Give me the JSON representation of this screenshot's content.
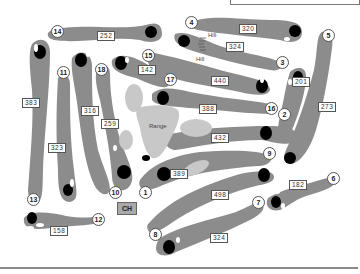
{
  "map": {
    "title": "Golf course layout",
    "colors": {
      "fairway": "#8c8c8c",
      "green": "#000000",
      "hazard_light": "#c8c8c8",
      "tee": "#ffffff",
      "background": "#ffffff"
    },
    "holes": [
      {
        "number": "1",
        "yardage": "389"
      },
      {
        "number": "2",
        "yardage": "201"
      },
      {
        "number": "3",
        "yardage": "324"
      },
      {
        "number": "4",
        "yardage": "320"
      },
      {
        "number": "5",
        "yardage": "273"
      },
      {
        "number": "6",
        "yardage": "182"
      },
      {
        "number": "7",
        "yardage": "324"
      },
      {
        "number": "8",
        "yardage": "498"
      },
      {
        "number": "9",
        "yardage": "432"
      },
      {
        "number": "10",
        "yardage": "259"
      },
      {
        "number": "11",
        "yardage": "323"
      },
      {
        "number": "12",
        "yardage": "158"
      },
      {
        "number": "13",
        "yardage": "383"
      },
      {
        "number": "14",
        "yardage": "252"
      },
      {
        "number": "15",
        "yardage": "142"
      },
      {
        "number": "16",
        "yardage": "388"
      },
      {
        "number": "17",
        "yardage": "440"
      },
      {
        "number": "18",
        "yardage": "316"
      }
    ],
    "labels": {
      "range": "Range",
      "hill_1": "Hill",
      "hill_2": "Hill",
      "clubhouse": "CH"
    }
  }
}
